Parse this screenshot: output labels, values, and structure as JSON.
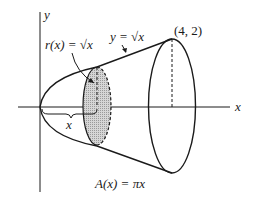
{
  "figure": {
    "axes": {
      "x_label": "x",
      "y_label": "y"
    },
    "labels": {
      "radius": "r(x) = √x",
      "curve": "y = √x",
      "endpoint": "(4, 2)",
      "position": "x",
      "area": "A(x) = πx"
    },
    "colors": {
      "stroke": "#1a1a1a",
      "shading": "#c8c8c8",
      "background": "#ffffff"
    }
  }
}
